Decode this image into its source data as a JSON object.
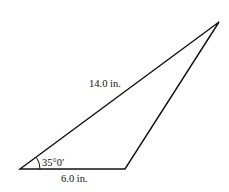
{
  "diagram": {
    "type": "triangle",
    "stroke_color": "#111111",
    "vertices": {
      "A": [
        20,
        169
      ],
      "B": [
        125,
        169
      ],
      "C": [
        219,
        22
      ]
    },
    "labels": {
      "side_ac": "14.0 in.",
      "side_ab": "6.0 in.",
      "angle_a": "35°0′"
    }
  }
}
